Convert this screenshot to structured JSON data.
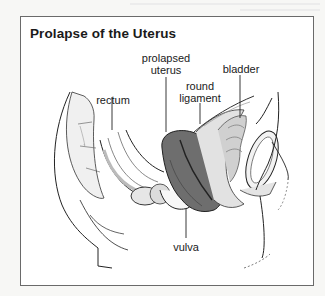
{
  "figure": {
    "title": "Prolapse of the Uterus",
    "labels": {
      "prolapsed_uterus_line1": "prolapsed",
      "prolapsed_uterus_line2": "uterus",
      "bladder": "bladder",
      "round_ligament_line1": "round",
      "round_ligament_line2": "ligament",
      "rectum": "rectum",
      "vulva": "vulva"
    },
    "colors": {
      "frame": "#6a6a6a",
      "uterus_fill": "#6e6e6e",
      "line": "#222222",
      "tissue": "#d8d8d8"
    }
  }
}
